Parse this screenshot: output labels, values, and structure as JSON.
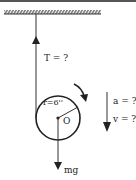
{
  "diagram": {
    "labels": {
      "tension": "T = ?",
      "radius": "r=6''",
      "center": "O",
      "weight": "mg",
      "acceleration": "a = ?",
      "velocity": "v = ?"
    },
    "colors": {
      "line": "#333333",
      "background": "#ffffff"
    }
  }
}
